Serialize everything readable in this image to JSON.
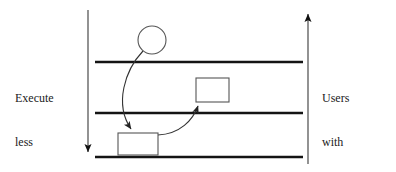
{
  "figure": {
    "background_color": "#ffffff",
    "stroke_color": "#111111",
    "band_line_color": "#141414",
    "shape_stroke_color": "#555555",
    "width": 396,
    "height": 172
  },
  "labels": {
    "left": {
      "name": "execute-less-secure-files-label",
      "lines": [
        "Execute",
        "less",
        "secure",
        "files"
      ]
    },
    "right": {
      "name": "users-with-higher-privilege-label",
      "lines": [
        "Users",
        "with",
        "higher",
        "privilege"
      ]
    }
  },
  "axes": {
    "left_arrow": {
      "label": "downward-direction-arrow",
      "direction": "down",
      "x": 88,
      "y_start": 10,
      "y_end": 158
    },
    "right_arrow": {
      "label": "upward-direction-arrow",
      "direction": "up",
      "x": 308,
      "y_start": 164,
      "y_end": 8
    }
  },
  "bands": [
    {
      "name": "privilege-boundary-line-1",
      "y": 62,
      "x_start": 95,
      "x_end": 303
    },
    {
      "name": "privilege-boundary-line-2",
      "y": 113,
      "x_start": 95,
      "x_end": 303
    },
    {
      "name": "privilege-boundary-line-3",
      "y": 157,
      "x_start": 95,
      "x_end": 303
    }
  ],
  "nodes": {
    "circle": {
      "name": "process-circle-node",
      "cx": 152,
      "cy": 40,
      "r": 14
    },
    "rect_upper": {
      "name": "upper-file-rectangle-node",
      "x": 196,
      "y": 78,
      "width": 33,
      "height": 24
    },
    "rect_lower": {
      "name": "lower-file-rectangle-node",
      "x": 118,
      "y": 133,
      "width": 40,
      "height": 22
    }
  },
  "arrows": [
    {
      "name": "curved-arrow-circle-to-lower-rect",
      "path": "M 143 51 C 125 70, 114 104, 132 131",
      "tip": [
        133,
        133
      ]
    },
    {
      "name": "curved-arrow-lower-rect-to-upper-rect",
      "path": "M 158 135 C 180 134, 193 120, 199 104",
      "tip": [
        200,
        102
      ]
    }
  ]
}
